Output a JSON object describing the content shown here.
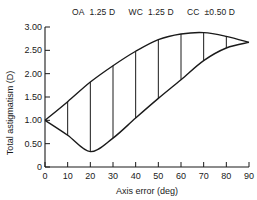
{
  "chart_data": {
    "type": "area",
    "title": "",
    "legend": [
      {
        "label": "OA",
        "value": "1.25 D"
      },
      {
        "label": "WC",
        "value": "1.25 D"
      },
      {
        "label": "CC",
        "value": "±0.50 D"
      }
    ],
    "xlabel": "Axis error (deg)",
    "ylabel": "Total astigmatism (D)",
    "xlim": [
      0,
      90
    ],
    "ylim": [
      0,
      3.0
    ],
    "x_ticks": [
      0,
      10,
      20,
      30,
      40,
      50,
      60,
      70,
      80,
      90
    ],
    "x_tick_labels": [
      "0",
      "10",
      "20",
      "30",
      "40",
      "50",
      "60",
      "70",
      "80",
      "90"
    ],
    "y_ticks": [
      0,
      0.5,
      1.0,
      1.5,
      2.0,
      2.5,
      3.0
    ],
    "y_tick_labels": [
      "0",
      "0.50",
      "1.00",
      "1.50",
      "2.00",
      "2.50",
      "3.00"
    ],
    "grid": false,
    "x": [
      0,
      10,
      20,
      30,
      40,
      50,
      60,
      70,
      80,
      90
    ],
    "series": [
      {
        "name": "Upper bound",
        "values": [
          1.0,
          1.4,
          1.82,
          2.17,
          2.48,
          2.73,
          2.85,
          2.88,
          2.8,
          2.67
        ]
      },
      {
        "name": "Lower bound",
        "values": [
          1.0,
          0.68,
          0.33,
          0.62,
          1.05,
          1.47,
          1.87,
          2.28,
          2.55,
          2.67
        ]
      }
    ],
    "vertical_connectors_at": [
      10,
      20,
      30,
      40,
      50,
      60,
      70,
      80
    ]
  }
}
